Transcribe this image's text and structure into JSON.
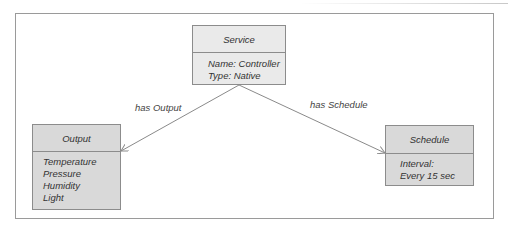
{
  "diagram": {
    "nodes": [
      {
        "id": "service",
        "title": "Service",
        "lines": [
          "Name: Controller",
          "Type: Native"
        ]
      },
      {
        "id": "output",
        "title": "Output",
        "lines": [
          "Temperature",
          "Pressure",
          "Humidity",
          "Light"
        ]
      },
      {
        "id": "schedule",
        "title": "Schedule",
        "lines": [
          "Interval:",
          "Every 15 sec"
        ]
      }
    ],
    "edges": [
      {
        "from": "service",
        "to": "output",
        "label": "has Output"
      },
      {
        "from": "service",
        "to": "schedule",
        "label": "has Schedule"
      }
    ],
    "colors": {
      "header_fill_service": "#eaeaea",
      "fill_leaf": "#d9d9d9",
      "stroke": "#8c8c8c",
      "edge": "#8a8a8a"
    }
  }
}
